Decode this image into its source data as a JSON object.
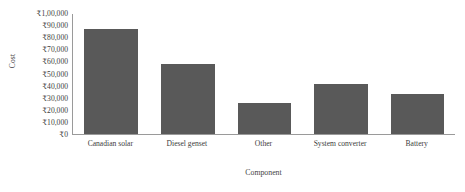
{
  "chart_data": {
    "type": "bar",
    "title": "",
    "xlabel": "Component",
    "ylabel": "Cost",
    "categories": [
      "Canadian solar",
      "Diesel genset",
      "Other",
      "System converter",
      "Battery"
    ],
    "values": [
      87000,
      58000,
      26000,
      41000,
      33000
    ],
    "ylim": [
      0,
      100000
    ],
    "ytick_values": [
      0,
      10000,
      20000,
      30000,
      40000,
      50000,
      60000,
      70000,
      80000,
      90000,
      100000
    ],
    "ytick_labels": [
      "₹0",
      "₹10,000",
      "₹20,000",
      "₹30,000",
      "₹40,000",
      "₹50,000",
      "₹60,000",
      "₹70,000",
      "₹80,000",
      "₹90,000",
      "₹1,00,000"
    ],
    "grid": false,
    "legend": false,
    "bar_color": "#595959",
    "axis_color": "#9a9a9a"
  }
}
